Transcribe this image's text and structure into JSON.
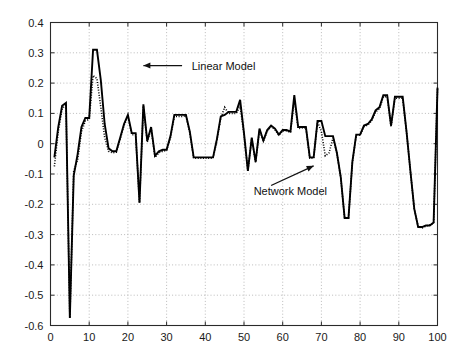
{
  "chart_data": {
    "type": "line",
    "title": "",
    "xlabel": "",
    "ylabel": "",
    "xlim": [
      0,
      100
    ],
    "ylim": [
      -0.6,
      0.4
    ],
    "grid": true,
    "grid_style": "dotted",
    "legend_position": "none",
    "xticks": [
      0,
      10,
      20,
      30,
      40,
      50,
      60,
      70,
      80,
      90,
      100
    ],
    "yticks": [
      -0.6,
      -0.5,
      -0.4,
      -0.3,
      -0.2,
      -0.1,
      0,
      0.1,
      0.2,
      0.3,
      0.4
    ],
    "xtick_labels": [
      "0",
      "10",
      "20",
      "30",
      "40",
      "50",
      "60",
      "70",
      "80",
      "90",
      "100"
    ],
    "ytick_labels": [
      "-0.6",
      "-0.5",
      "-0.4",
      "-0.3",
      "-0.2",
      "-0.1",
      "0",
      "0.1",
      "0.2",
      "0.3",
      "0.4"
    ],
    "annotations": [
      {
        "text": "Linear Model",
        "text_x": 36.5,
        "text_y": 0.258,
        "arrow_from_x": 34.0,
        "arrow_from_y": 0.258,
        "arrow_to_x": 24.0,
        "arrow_to_y": 0.258,
        "style": "horizontal-arrow-left"
      },
      {
        "text": "Network Model",
        "text_x": 52.5,
        "text_y": -0.155,
        "arrow_from_x": 57.0,
        "arrow_from_y": -0.138,
        "arrow_to_x": 68.0,
        "arrow_to_y": -0.073,
        "style": "diagonal-arrow-upright"
      }
    ],
    "series": [
      {
        "name": "Linear Model",
        "style": "solid",
        "color": "#000000",
        "x": [
          1,
          2,
          3,
          4,
          5,
          6,
          7,
          8,
          9,
          10,
          11,
          12,
          13,
          14,
          15,
          16,
          17,
          18,
          19,
          20,
          21,
          22,
          23,
          24,
          25,
          26,
          27,
          28,
          29,
          30,
          31,
          32,
          33,
          34,
          35,
          36,
          37,
          38,
          39,
          40,
          41,
          42,
          43,
          44,
          45,
          46,
          47,
          48,
          49,
          50,
          51,
          52,
          53,
          54,
          55,
          56,
          57,
          58,
          59,
          60,
          61,
          62,
          63,
          64,
          65,
          66,
          67,
          68,
          69,
          70,
          71,
          72,
          73,
          74,
          75,
          76,
          77,
          78,
          79,
          80,
          81,
          82,
          83,
          84,
          85,
          86,
          87,
          88,
          89,
          90,
          91,
          92,
          93,
          94,
          95,
          96,
          97,
          98,
          99,
          100
        ],
        "y": [
          -0.045,
          0.055,
          0.125,
          0.135,
          -0.575,
          -0.105,
          -0.035,
          0.055,
          0.085,
          0.085,
          0.31,
          0.31,
          0.21,
          0.065,
          -0.015,
          -0.025,
          -0.025,
          0.02,
          0.065,
          0.095,
          0.035,
          0.035,
          -0.195,
          0.13,
          0.01,
          0.055,
          -0.04,
          -0.025,
          -0.02,
          -0.02,
          0.025,
          0.095,
          0.095,
          0.095,
          0.095,
          0.04,
          -0.045,
          -0.045,
          -0.045,
          -0.045,
          -0.045,
          -0.045,
          0.015,
          0.09,
          0.095,
          0.105,
          0.105,
          0.105,
          0.145,
          0.035,
          -0.09,
          0.02,
          -0.06,
          0.05,
          0.01,
          0.045,
          0.06,
          0.05,
          0.03,
          0.045,
          0.045,
          0.04,
          0.16,
          0.055,
          0.055,
          0.055,
          -0.045,
          -0.045,
          0.075,
          0.075,
          0.025,
          0.025,
          0.025,
          -0.03,
          -0.11,
          -0.245,
          -0.245,
          -0.06,
          0.03,
          0.03,
          0.06,
          0.065,
          0.08,
          0.11,
          0.12,
          0.16,
          0.16,
          0.06,
          0.155,
          0.155,
          0.155,
          0.04,
          -0.09,
          -0.215,
          -0.275,
          -0.275,
          -0.27,
          -0.27,
          -0.26,
          0.185
        ]
      },
      {
        "name": "Network Model",
        "style": "dotted",
        "color": "#000000",
        "x": [
          1,
          2,
          3,
          4,
          5,
          6,
          7,
          8,
          9,
          10,
          11,
          12,
          13,
          14,
          15,
          16,
          17,
          18,
          19,
          20,
          21,
          22,
          23,
          24,
          25,
          26,
          27,
          28,
          29,
          30,
          31,
          32,
          33,
          34,
          35,
          36,
          37,
          38,
          39,
          40,
          41,
          42,
          43,
          44,
          45,
          46,
          47,
          48,
          49,
          50,
          51,
          52,
          53,
          54,
          55,
          56,
          57,
          58,
          59,
          60,
          61,
          62,
          63,
          64,
          65,
          66,
          67,
          68,
          69,
          70,
          71,
          72,
          73,
          74,
          75,
          76,
          77,
          78,
          79,
          80,
          81,
          82,
          83,
          84,
          85,
          86,
          87,
          88,
          89,
          90,
          91,
          92,
          93,
          94,
          95,
          96,
          97,
          98,
          99,
          100
        ],
        "y": [
          -0.075,
          0.04,
          0.115,
          0.13,
          -0.575,
          -0.09,
          -0.055,
          0.04,
          0.075,
          0.08,
          0.225,
          0.215,
          0.12,
          0.02,
          -0.025,
          -0.03,
          -0.028,
          0.015,
          0.06,
          0.09,
          0.03,
          0.03,
          -0.195,
          0.125,
          0.005,
          0.05,
          -0.045,
          -0.03,
          -0.025,
          -0.022,
          0.02,
          0.09,
          0.09,
          0.09,
          0.092,
          0.035,
          -0.048,
          -0.048,
          -0.048,
          -0.048,
          -0.048,
          -0.048,
          0.012,
          0.085,
          0.12,
          0.1,
          0.1,
          0.1,
          0.125,
          0.03,
          -0.09,
          0.018,
          -0.062,
          0.046,
          0.008,
          0.042,
          0.056,
          0.046,
          0.028,
          0.042,
          0.042,
          0.038,
          0.145,
          0.05,
          0.052,
          0.052,
          -0.048,
          -0.048,
          0.072,
          0.04,
          -0.04,
          -0.03,
          0.02,
          -0.032,
          -0.112,
          -0.245,
          -0.245,
          -0.062,
          0.028,
          0.028,
          0.056,
          0.062,
          0.076,
          0.105,
          0.115,
          0.155,
          0.155,
          0.056,
          0.15,
          0.15,
          0.15,
          0.038,
          -0.092,
          -0.215,
          -0.275,
          -0.278,
          -0.272,
          -0.268,
          -0.262,
          0.182
        ]
      }
    ]
  },
  "axes": {
    "frame_color": "#000000",
    "grid_color": "#aaaaaa",
    "background": "#ffffff"
  }
}
